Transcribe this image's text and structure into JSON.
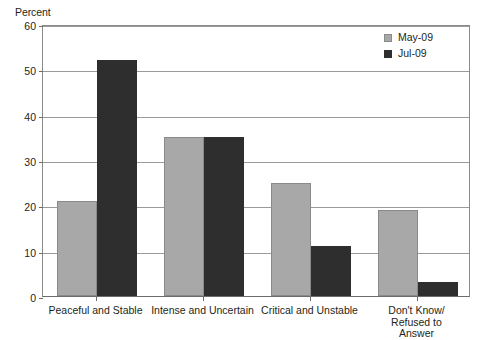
{
  "chart_data": {
    "type": "bar",
    "title": "",
    "xlabel": "",
    "ylabel": "Percent",
    "ylim": [
      0,
      60
    ],
    "yticks": [
      0,
      10,
      20,
      30,
      40,
      50,
      60
    ],
    "grid": true,
    "legend_position": "top-right",
    "categories": [
      "Peaceful and Stable",
      "Intense and Uncertain",
      "Critical and Unstable",
      "Don't Know/\nRefused to Answer"
    ],
    "series": [
      {
        "name": "May-09",
        "color": "#a8a8a8",
        "values": [
          21,
          35,
          25,
          19
        ]
      },
      {
        "name": "Jul-09",
        "color": "#2e2e2e",
        "values": [
          52,
          35,
          11,
          3
        ]
      }
    ]
  },
  "axis": {
    "y_title": "Percent"
  },
  "legend": {
    "items": [
      {
        "label": "May-09",
        "color": "#a8a8a8"
      },
      {
        "label": "Jul-09",
        "color": "#2e2e2e"
      }
    ]
  }
}
